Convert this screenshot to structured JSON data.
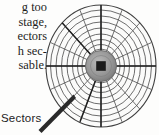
{
  "figure": {
    "kind": "hard-disk-platter-diagram",
    "caption": "Sectors",
    "hub": {
      "color": "#8e8e8e",
      "spindle_color": "#1b1b1b"
    },
    "platter": {
      "track_count": 9,
      "sector_count": 16,
      "line_color": "#4a4a4a",
      "bold_sector_color": "#1f1f1f",
      "fill_color": "#fbfbfa"
    }
  },
  "body_text": {
    "lines": [
      "g  too",
      "stage,",
      "ectors",
      "h sec-",
      "sable."
    ]
  }
}
